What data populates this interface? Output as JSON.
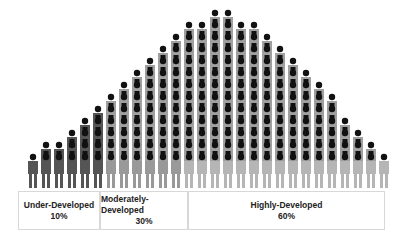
{
  "chart_data": {
    "type": "pictogram-bell-curve",
    "title": "",
    "categories": [
      "Under-Developed",
      "Moderately-Developed",
      "Highly-Developed"
    ],
    "values": [
      10,
      30,
      60
    ],
    "value_labels": [
      "10%",
      "30%",
      "60%"
    ],
    "colors": {
      "under": "#555555",
      "moderate": "#999999",
      "high": "#b5b5b5",
      "head": "#111111"
    },
    "column_heights": [
      1,
      2,
      2,
      3,
      4,
      5,
      6,
      7,
      8,
      9,
      10,
      11,
      12,
      12,
      13,
      13,
      12,
      12,
      11,
      10,
      9,
      8,
      7,
      6,
      4,
      3,
      2,
      1
    ],
    "axis": "none",
    "grid": false
  },
  "labels": {
    "under": {
      "name": "Under-Developed",
      "pct": "10%"
    },
    "moderate": {
      "name": "Moderately-Developed",
      "pct": "30%"
    },
    "high": {
      "name": "Highly-Developed",
      "pct": "60%"
    }
  }
}
